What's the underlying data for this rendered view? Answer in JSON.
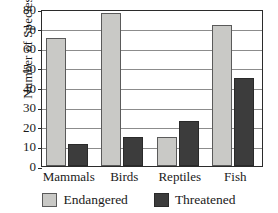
{
  "chart_data": {
    "type": "bar",
    "title": "",
    "subtitle": "",
    "xlabel": "",
    "ylabel": "Number of Species",
    "categories": [
      "Mammals",
      "Birds",
      "Reptiles",
      "Fish"
    ],
    "series": [
      {
        "name": "Endangered",
        "color": "#c9c9c6",
        "values": [
          65,
          78,
          15,
          72
        ]
      },
      {
        "name": "Threatened",
        "color": "#3c3c3c",
        "values": [
          11,
          15,
          23,
          45
        ]
      }
    ],
    "ylim": [
      0,
      80
    ],
    "ytick_step": 10,
    "yticks": [
      0,
      10,
      20,
      30,
      40,
      50,
      60,
      70,
      80
    ],
    "ytick_labels": [
      "0",
      "10",
      "20",
      "30",
      "40",
      "50",
      "60",
      "70",
      "80"
    ],
    "grid": true,
    "grid_axis": "y",
    "legend_position": "bottom",
    "legend_entries": [
      "Endangered",
      "Threatened"
    ],
    "annotations": []
  },
  "axes": {
    "y_title": "Number of Species"
  },
  "legend": {
    "items": [
      {
        "label": "Endangered",
        "swatch": "endangered-swatch"
      },
      {
        "label": "Threatened",
        "swatch": "threatened-swatch"
      }
    ]
  }
}
